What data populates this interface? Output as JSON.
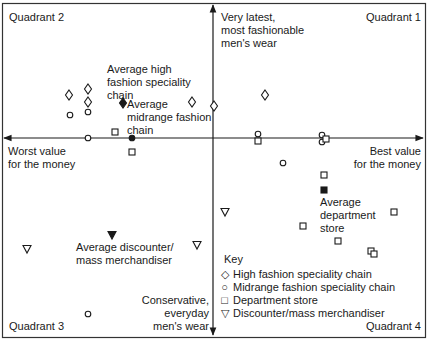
{
  "chart_data": {
    "type": "scatter",
    "title": "",
    "x_axis": {
      "left_label": "Worst value for the money",
      "right_label": "Best value for the money",
      "range": [
        -1,
        1
      ]
    },
    "y_axis": {
      "top_label": "Very latest, most fashionable men's wear",
      "bottom_label": "Conservative, everyday men's wear",
      "range": [
        -1,
        1
      ]
    },
    "quadrants": {
      "q1": "Quadrant 1",
      "q2": "Quadrant 2",
      "q3": "Quadrant 3",
      "q4": "Quadrant 4"
    },
    "series": [
      {
        "name": "High fashion speciality chain",
        "marker": "diamond-open",
        "points_px": [
          [
            69,
            95
          ],
          [
            88,
            89
          ],
          [
            88,
            102
          ],
          [
            192,
            102
          ],
          [
            214,
            106
          ],
          [
            265,
            95
          ]
        ]
      },
      {
        "name": "Midrange fashion speciality chain",
        "marker": "circle-open",
        "points_px": [
          [
            70,
            115
          ],
          [
            88,
            112
          ],
          [
            88,
            138
          ],
          [
            258,
            134
          ],
          [
            322,
            135
          ],
          [
            322,
            142
          ],
          [
            283,
            163
          ],
          [
            88,
            314
          ]
        ]
      },
      {
        "name": "Department store",
        "marker": "square-open",
        "points_px": [
          [
            115,
            132
          ],
          [
            132,
            152
          ],
          [
            258,
            141
          ],
          [
            326,
            139
          ],
          [
            324,
            175
          ],
          [
            394,
            212
          ],
          [
            303,
            226
          ],
          [
            338,
            241
          ],
          [
            371,
            251
          ],
          [
            374,
            254
          ]
        ]
      },
      {
        "name": "Discounter/mass merchandiser",
        "marker": "triangle-down-open",
        "points_px": [
          [
            27,
            249
          ],
          [
            197,
            245
          ],
          [
            225,
            212
          ]
        ]
      }
    ],
    "averages": [
      {
        "label": "Average high fashion speciality chain",
        "marker": "diamond-filled",
        "point_px": [
          123,
          103
        ]
      },
      {
        "label": "Average midrange fashion chain",
        "marker": "circle-filled",
        "point_px": [
          132,
          138
        ]
      },
      {
        "label": "Average department store",
        "marker": "square-filled",
        "point_px": [
          324,
          190
        ]
      },
      {
        "label": "Average discounter/ mass merchandiser",
        "marker": "triangle-down-filled",
        "point_px": [
          112,
          235
        ]
      }
    ],
    "legend": {
      "title": "Key",
      "position": "lower-right",
      "entries": [
        "High fashion speciality chain",
        "Midrange fashion speciality chain",
        "Department store",
        "Discounter/mass merchandiser"
      ]
    },
    "grid": false
  },
  "labels": {
    "quadrant2": "Quadrant 2",
    "quadrant1": "Quadrant 1",
    "quadrant3": "Quadrant 3",
    "quadrant4": "Quadrant 4",
    "top_axis_1": "Very latest,",
    "top_axis_2": "most fashionable",
    "top_axis_3": "men's wear",
    "bottom_axis_1": "Conservative,",
    "bottom_axis_2": "everyday",
    "bottom_axis_3": "men's wear",
    "left_axis_1": "Worst value",
    "left_axis_2": "for the money",
    "right_axis_1": "Best value",
    "right_axis_2": "for the money",
    "avg_high_1": "Average high",
    "avg_high_2": "fashion speciality",
    "avg_high_3": "chain",
    "avg_mid_1": "Average",
    "avg_mid_2": "midrange fashion",
    "avg_mid_3": "chain",
    "avg_dept_1": "Average",
    "avg_dept_2": "department",
    "avg_dept_3": "store",
    "avg_disc_1": "Average discounter/",
    "avg_disc_2": "mass merchandiser"
  },
  "legend": {
    "title": "Key",
    "items": [
      {
        "symbol": "◇",
        "label": "High fashion speciality chain"
      },
      {
        "symbol": "○",
        "label": "Midrange fashion speciality chain"
      },
      {
        "symbol": "□",
        "label": "Department store"
      },
      {
        "symbol": "▽",
        "label": "Discounter/mass merchandiser"
      }
    ]
  }
}
